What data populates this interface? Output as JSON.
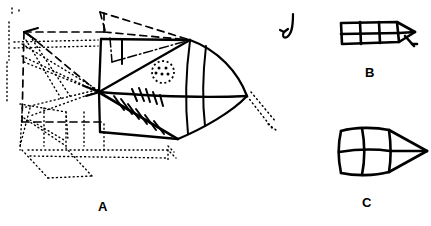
{
  "figure": {
    "kind": "hand-drawn-sketch",
    "background_color": "#ffffff",
    "ink_color": "#000000",
    "width": 431,
    "height": 226,
    "labels": {
      "a": "A",
      "b": "B",
      "c": "C"
    },
    "panels": [
      {
        "id": "A",
        "label": "A",
        "description": "Large hand-drawn fish/projectile body with gridded panels, an eye marked by a dotted circle, hatched fin strokes, and dashed plus dotted perspective construction lines extending to the left and lower-left.",
        "features": [
          "body-outline",
          "panel-grid",
          "eye-dotted-circle",
          "hatched-fin",
          "dashed-construction-lines",
          "dotted-construction-lines",
          "arrow-head-left",
          "dotted-tail-trail"
        ]
      },
      {
        "id": "B",
        "label": "B",
        "description": "Small gridded block with a pointed nose and a short angled stick at the lower right, shown in a flattened, foreshortened view.",
        "features": [
          "grid-block",
          "pointed-nose",
          "angled-stick"
        ]
      },
      {
        "id": "C",
        "label": "C",
        "description": "Medium gridded block with a triangular pointed nose, drawn in a squarer, less foreshortened view.",
        "features": [
          "grid-block",
          "pointed-nose"
        ]
      }
    ],
    "annotations": [
      {
        "id": "down-arrow",
        "name": "curved-down-arrow",
        "description": "Small curved arrow pointing downward, to the left of panel B."
      }
    ],
    "line_styles": {
      "solid": "solid ink stroke",
      "dashed": "long dashed construction line",
      "dotted": "fine dotted construction line",
      "dashdot": "dash-dot centreline"
    }
  }
}
